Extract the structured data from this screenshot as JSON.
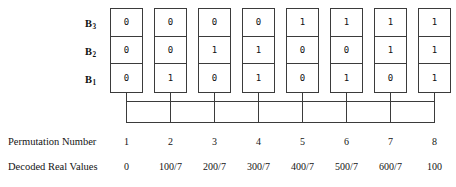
{
  "figure": {
    "row_labels": [
      {
        "name": "B",
        "subscript": "3"
      },
      {
        "name": "B",
        "subscript": "2"
      },
      {
        "name": "B",
        "subscript": "1"
      }
    ],
    "captions": {
      "permutation_number": "Permutation Number",
      "decoded_real_values": "Decoded Real Values"
    },
    "permutation_numbers": [
      "1",
      "2",
      "3",
      "4",
      "5",
      "6",
      "7",
      "8"
    ],
    "decoded_real_values": [
      "0",
      "100/7",
      "200/7",
      "300/7",
      "400/7",
      "500/7",
      "600/7",
      "100"
    ],
    "bits": {
      "B3": [
        "0",
        "0",
        "0",
        "0",
        "1",
        "1",
        "1",
        "1"
      ],
      "B2": [
        "0",
        "0",
        "1",
        "1",
        "0",
        "0",
        "1",
        "1"
      ],
      "B1": [
        "0",
        "1",
        "0",
        "1",
        "0",
        "1",
        "0",
        "1"
      ]
    },
    "colors": {
      "background": "#ffffff",
      "line": "#3b3b3b",
      "text": "#141414"
    }
  }
}
